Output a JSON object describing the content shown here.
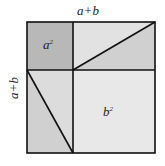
{
  "diagram": {
    "top_label": "a+b",
    "side_label": "a+b",
    "a_square_label": "a",
    "a_square_exp": "2",
    "b_square_label": "b",
    "b_square_exp": "2",
    "colors": {
      "a_square": "#b8b8b8",
      "triangle_light": "#d6d6d6",
      "triangle_dark": "#c9c9c9",
      "b_square": "#e6e6e6",
      "stroke": "#111111"
    }
  }
}
